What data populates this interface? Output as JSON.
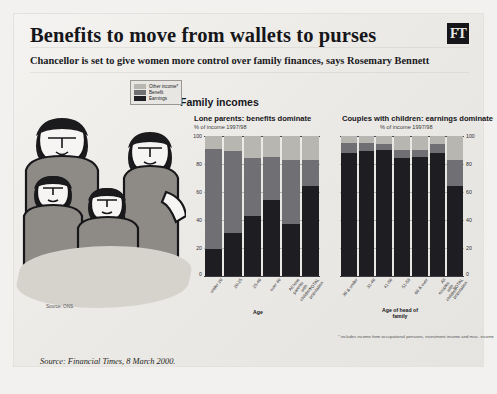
{
  "masthead": {
    "headline": "Benefits to move from wallets to purses",
    "logo": "FT",
    "standfirst": "Chancellor is set to give women more control over family finances, says Rosemary Bennett"
  },
  "figure": {
    "title": "Family incomes",
    "source_note": "Source: ONS",
    "footnote": "* includes income from occupational pensions, investment income and misc. income",
    "legend": [
      {
        "label": "Other income*",
        "color": "#b8b6b1",
        "key": "other"
      },
      {
        "label": "Benefit",
        "color": "#6f6f74",
        "key": "benefit"
      },
      {
        "label": "Earnings",
        "color": "#1e1e22",
        "key": "earnings"
      }
    ]
  },
  "attribution": "Source: Financial Times, 8 March 2000.",
  "chart_data": [
    {
      "id": "lone-parents",
      "type": "bar",
      "stacked": true,
      "title": "Lone parents: benefits dominate",
      "subtitle": "% of income 1997/98",
      "xlabel": "Age",
      "ylabel": "",
      "ylim": [
        0,
        100
      ],
      "yticks": [
        0,
        20,
        40,
        60,
        80,
        100
      ],
      "grid": true,
      "legend_position": "top-right",
      "categories": [
        "under 20",
        "20-25",
        "25-40",
        "over 40",
        "All lone parents with children",
        "TOTAL population"
      ],
      "series": [
        {
          "name": "Earnings",
          "color": "#1e1e22",
          "values": [
            19,
            31,
            43,
            54,
            37,
            64
          ]
        },
        {
          "name": "Benefit",
          "color": "#6f6f74",
          "values": [
            72,
            58,
            41,
            31,
            46,
            19
          ]
        },
        {
          "name": "Other income*",
          "color": "#b8b6b1",
          "values": [
            9,
            11,
            16,
            15,
            17,
            17
          ]
        }
      ]
    },
    {
      "id": "couples-with-children",
      "type": "bar",
      "stacked": true,
      "title": "Couples with children: earnings dominate",
      "subtitle": "% of income 1997/98",
      "xlabel": "Age of head of family",
      "ylabel": "",
      "ylim": [
        0,
        100
      ],
      "yticks": [
        0,
        20,
        40,
        60,
        80,
        100
      ],
      "grid": true,
      "legend_position": "shared",
      "categories": [
        "30 & under",
        "31-40",
        "41-50",
        "51-59",
        "60 & over",
        "All couples with children",
        "TOTAL population"
      ],
      "series": [
        {
          "name": "Earnings",
          "color": "#1e1e22",
          "values": [
            88,
            89,
            90,
            84,
            85,
            88,
            64
          ]
        },
        {
          "name": "Benefit",
          "color": "#6f6f74",
          "values": [
            7,
            6,
            4,
            6,
            5,
            6,
            19
          ]
        },
        {
          "name": "Other income*",
          "color": "#b8b6b1",
          "values": [
            5,
            5,
            6,
            10,
            10,
            6,
            17
          ]
        }
      ]
    }
  ]
}
